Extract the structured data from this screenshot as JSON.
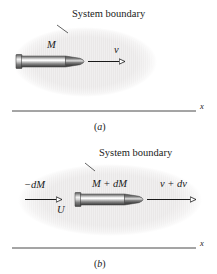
{
  "figure": {
    "type": "physics-diagram",
    "background_color": "#ffffff",
    "ink_color": "#1a1a1a",
    "boundary_fill_color": "#ebe9e9",
    "rocket_dark_color": "#4a4a4a",
    "rocket_highlight_color": "#ffffff"
  },
  "panel_a": {
    "caption": "(a)",
    "caption_open": "(",
    "caption_letter": "a",
    "caption_close": ")",
    "system_boundary_label": "System boundary",
    "mass_label": "M",
    "velocity_label": "v",
    "axis_label": "x"
  },
  "panel_b": {
    "caption": "(b)",
    "caption_open": "(",
    "caption_letter": "b",
    "caption_close": ")",
    "system_boundary_label": "System boundary",
    "ejected_mass_label": "−dM",
    "ejected_velocity_label": "U",
    "mass_label": "M + dM",
    "velocity_label": "v + dv",
    "axis_label": "x"
  }
}
